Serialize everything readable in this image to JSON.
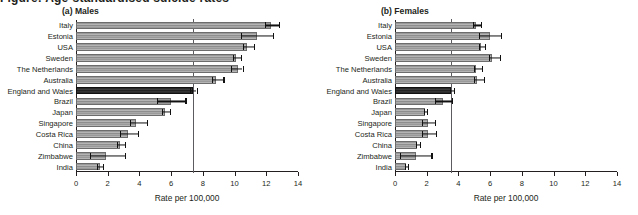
{
  "figure": {
    "cut_off_title": "Figure: Age-standardised suicide rates",
    "axis_title": "Rate per 100,000",
    "x_ticks": [
      0,
      2,
      4,
      6,
      8,
      10,
      12,
      14
    ],
    "xlim": [
      0,
      14
    ],
    "highlight_country": "England and Wales",
    "colors": {
      "bar": "#9a9a9a",
      "bar_highlight": "#2b2b2b",
      "error": "#111111",
      "refline": "#5b5b60",
      "text": "#231f20"
    }
  },
  "chart_data": [
    {
      "type": "bar",
      "title": "(a) Males",
      "xlabel": "Rate per 100,000",
      "ylabel": "",
      "xlim": [
        0,
        14
      ],
      "xticks": [
        0,
        2,
        4,
        6,
        8,
        10,
        12,
        14
      ],
      "grid": false,
      "orientation": "horizontal",
      "reference_line": 7.4,
      "categories": [
        "Italy",
        "Estonia",
        "USA",
        "Sweden",
        "The Netherlands",
        "Australia",
        "England and Wales",
        "Brazil",
        "Japan",
        "Singapore",
        "Costa Rica",
        "China",
        "Zimbabwe",
        "India"
      ],
      "values": [
        12.3,
        11.4,
        10.8,
        10.1,
        10.2,
        8.8,
        7.4,
        6.0,
        5.6,
        3.8,
        3.3,
        2.8,
        1.9,
        1.5
      ],
      "ci_low": [
        11.9,
        10.4,
        10.5,
        9.9,
        9.8,
        8.6,
        7.2,
        5.1,
        5.4,
        3.4,
        2.8,
        2.6,
        0.9,
        1.3
      ],
      "ci_high": [
        12.8,
        12.4,
        11.2,
        10.4,
        10.5,
        9.3,
        7.6,
        6.9,
        5.9,
        4.5,
        3.9,
        3.1,
        3.1,
        1.7
      ]
    },
    {
      "type": "bar",
      "title": "(b) Females",
      "xlabel": "Rate per 100,000",
      "ylabel": "",
      "xlim": [
        0,
        14
      ],
      "xticks": [
        0,
        2,
        4,
        6,
        8,
        10,
        12,
        14
      ],
      "grid": false,
      "orientation": "horizontal",
      "reference_line": 3.55,
      "categories": [
        "Italy",
        "Estonia",
        "USA",
        "Sweden",
        "The Netherlands",
        "Australia",
        "England and Wales",
        "Brazil",
        "Japan",
        "Singapore",
        "Costa Rica",
        "China",
        "Zimbabwe",
        "India"
      ],
      "values": [
        5.1,
        6.0,
        5.4,
        6.1,
        5.1,
        5.2,
        3.55,
        3.0,
        1.9,
        2.1,
        2.1,
        1.4,
        1.3,
        0.7
      ],
      "ci_low": [
        4.9,
        5.3,
        5.3,
        5.9,
        5.0,
        5.0,
        3.45,
        2.5,
        1.8,
        1.7,
        1.7,
        1.3,
        0.3,
        0.6
      ],
      "ci_high": [
        5.4,
        6.7,
        5.7,
        6.6,
        5.5,
        5.6,
        3.7,
        3.6,
        2.0,
        2.5,
        2.6,
        1.6,
        2.3,
        0.8
      ]
    }
  ]
}
